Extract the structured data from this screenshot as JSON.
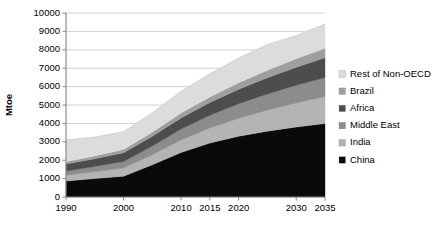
{
  "chart_data": {
    "type": "area",
    "title": "",
    "xlabel": "",
    "ylabel": "Mtoe",
    "ylim": [
      0,
      10000
    ],
    "xlim": [
      1990,
      2035
    ],
    "grid": true,
    "legend_position": "right",
    "stacked": true,
    "stack_order_bottom_to_top": [
      "China",
      "India",
      "Middle East",
      "Africa",
      "Brazil",
      "Rest of Non-OECD"
    ],
    "y_ticks": [
      0,
      1000,
      2000,
      3000,
      4000,
      5000,
      6000,
      7000,
      8000,
      9000,
      10000
    ],
    "x_ticks": [
      1990,
      2000,
      2010,
      2015,
      2020,
      2030,
      2035
    ],
    "x_tick_labels": [
      "1990",
      "2000",
      "2010",
      "2015",
      "2020",
      "2030",
      "2035"
    ],
    "x": [
      1990,
      1995,
      2000,
      2005,
      2010,
      2015,
      2020,
      2025,
      2030,
      2035
    ],
    "series": [
      {
        "name": "China",
        "color": "#0a0a0a",
        "values": [
          870,
          1000,
          1130,
          1750,
          2420,
          2930,
          3300,
          3580,
          3800,
          3990
        ]
      },
      {
        "name": "India",
        "color": "#b4b4b4",
        "values": [
          310,
          370,
          440,
          540,
          680,
          820,
          980,
          1140,
          1310,
          1470
        ]
      },
      {
        "name": "Middle East",
        "color": "#8c8c8c",
        "values": [
          230,
          290,
          360,
          480,
          590,
          690,
          790,
          880,
          960,
          1030
        ]
      },
      {
        "name": "Africa",
        "color": "#4d4d4d",
        "values": [
          380,
          420,
          470,
          530,
          610,
          690,
          780,
          880,
          980,
          1080
        ]
      },
      {
        "name": "Brazil",
        "color": "#9e9e9e",
        "values": [
          130,
          155,
          185,
          220,
          265,
          310,
          360,
          410,
          460,
          510
        ]
      },
      {
        "name": "Rest of Non-OECD",
        "color": "#dcdcdc",
        "values": [
          1180,
          1020,
          960,
          1060,
          1180,
          1260,
          1340,
          1400,
          1260,
          1320
        ]
      }
    ],
    "totals": [
      3100,
      3255,
      3545,
      4580,
      5745,
      6700,
      7550,
      8290,
      8770,
      9400
    ]
  },
  "axis": {
    "y_label": "Mtoe"
  },
  "legend": {
    "items": [
      {
        "label": "Rest of Non-OECD",
        "color": "#dcdcdc"
      },
      {
        "label": "Brazil",
        "color": "#9e9e9e"
      },
      {
        "label": "Africa",
        "color": "#4d4d4d"
      },
      {
        "label": "Middle East",
        "color": "#8c8c8c"
      },
      {
        "label": "India",
        "color": "#b4b4b4"
      },
      {
        "label": "China",
        "color": "#0a0a0a"
      }
    ]
  }
}
